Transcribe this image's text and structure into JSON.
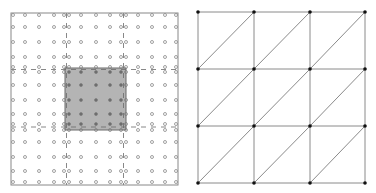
{
  "figure": {
    "colors": {
      "background": "#ffffff",
      "frame": "#888888",
      "circle_stroke": "#7a7a7a",
      "shaded_fill": "#b4b4b4",
      "shaded_border": "#6a6a6a",
      "dashed_line": "#6a6a6a",
      "inner_dot": "#6e6e6e",
      "mesh_edge": "#8a8a8a",
      "node": "#111111"
    }
  },
  "left_panel": {
    "name": "fine-grid",
    "frame": {
      "x": 11,
      "y": 13,
      "w": 167,
      "h": 172
    },
    "columns": [
      13,
      25,
      39,
      54,
      64,
      69,
      81,
      96,
      110,
      121,
      126,
      138,
      152,
      165,
      176
    ],
    "rows": [
      15,
      27,
      42,
      57,
      67,
      72,
      85,
      100,
      114,
      124,
      130,
      142,
      157,
      171,
      182
    ],
    "dashed_lines": {
      "vertical_x": [
        66.5,
        123.5
      ],
      "horizontal_y": [
        69.5,
        127
      ]
    },
    "shaded_region": {
      "x": 65,
      "y": 68,
      "w": 61,
      "h": 62
    },
    "circle_radius": 1.5
  },
  "right_panel": {
    "name": "coarse-triangulated-mesh",
    "nodes_x": [
      198,
      254,
      310,
      365
    ],
    "nodes_y": [
      12,
      69,
      126,
      183
    ],
    "cells": 3,
    "diagonal": "bottom-left-to-top-right",
    "node_radius": 1.8
  }
}
